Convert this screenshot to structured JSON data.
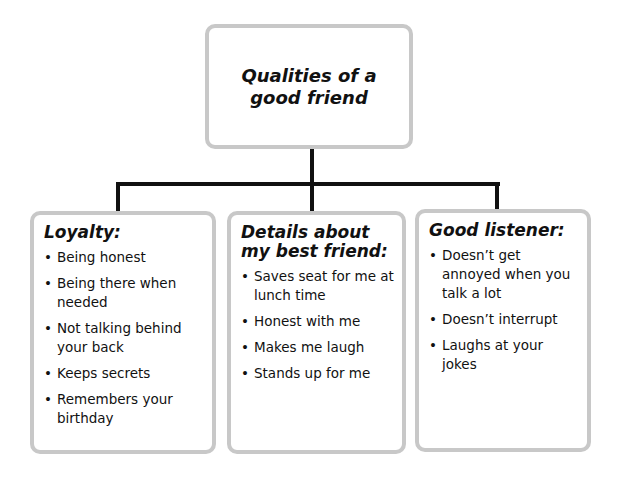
{
  "diagram": {
    "root": {
      "title": "Qualities of a good friend"
    },
    "branches": [
      {
        "title": "Loyalty:",
        "items": [
          "Being honest",
          "Being there when needed",
          "Not talking behind your back",
          "Keeps secrets",
          "Remembers your birthday"
        ]
      },
      {
        "title": "Details about my best friend:",
        "items": [
          "Saves seat for me at lunch time",
          "Honest with me",
          "Makes me laugh",
          "Stands up for me"
        ]
      },
      {
        "title": "Good listener:",
        "items": [
          "Doesn’t get annoyed when you talk a lot",
          "Doesn’t interrupt",
          "Laughs at your jokes"
        ]
      }
    ],
    "bullet": "•",
    "colors": {
      "box_border": "#c8c8c8",
      "connector": "#111111",
      "text": "#111111"
    }
  }
}
